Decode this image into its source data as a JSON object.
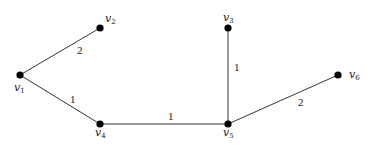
{
  "graph": {
    "nodes": [
      {
        "id": "v1",
        "base": "v",
        "sub": "1",
        "x": 20,
        "y": 75,
        "lx": 14,
        "ly": 91
      },
      {
        "id": "v2",
        "base": "v",
        "sub": "2",
        "x": 100,
        "y": 28,
        "lx": 105,
        "ly": 22
      },
      {
        "id": "v3",
        "base": "v",
        "sub": "3",
        "x": 228,
        "y": 28,
        "lx": 223,
        "ly": 21
      },
      {
        "id": "v4",
        "base": "v",
        "sub": "4",
        "x": 100,
        "y": 124,
        "lx": 95,
        "ly": 136
      },
      {
        "id": "v5",
        "base": "v",
        "sub": "5",
        "x": 228,
        "y": 124,
        "lx": 223,
        "ly": 136
      },
      {
        "id": "v6",
        "base": "v",
        "sub": "6",
        "x": 338,
        "y": 75,
        "lx": 349,
        "ly": 78
      }
    ],
    "edges": [
      {
        "from": "v1",
        "to": "v2",
        "weight": "2",
        "wx": 77,
        "wy": 54
      },
      {
        "from": "v1",
        "to": "v4",
        "weight": "1",
        "wx": 70,
        "wy": 103
      },
      {
        "from": "v4",
        "to": "v5",
        "weight": "1",
        "wx": 168,
        "wy": 120
      },
      {
        "from": "v3",
        "to": "v5",
        "weight": "1",
        "wx": 234,
        "wy": 71
      },
      {
        "from": "v5",
        "to": "v6",
        "weight": "2",
        "wx": 298,
        "wy": 106
      }
    ]
  }
}
